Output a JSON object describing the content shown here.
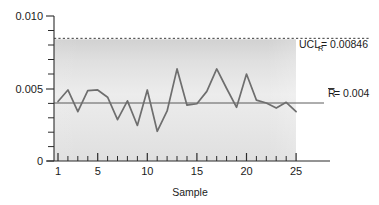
{
  "chart_data": {
    "type": "line",
    "title": "",
    "xlabel": "Sample",
    "ylabel": "",
    "xlim": [
      0.2,
      28.5
    ],
    "ylim": [
      0,
      0.01
    ],
    "grid": false,
    "legend_position": "none",
    "x_tick_labels": [
      "1",
      "5",
      "10",
      "15",
      "20",
      "25"
    ],
    "x_tick_values": [
      1,
      5,
      10,
      15,
      20,
      25
    ],
    "x_minor_ticks_every": 1,
    "y_tick_labels": [
      "0.010",
      "0.005",
      "0"
    ],
    "y_tick_values": [
      0.01,
      0.005,
      0
    ],
    "y_minor_ticks_every": 0.001,
    "series": [
      {
        "name": "R",
        "color": "#6e6e6e",
        "x": [
          1,
          2,
          3,
          4,
          5,
          6,
          7,
          8,
          9,
          10,
          11,
          12,
          13,
          14,
          15,
          16,
          17,
          18,
          19,
          20,
          21,
          22,
          23,
          24,
          25
        ],
        "values": [
          0.0041,
          0.0049,
          0.0034,
          0.00485,
          0.0049,
          0.0044,
          0.00285,
          0.00415,
          0.00245,
          0.0049,
          0.00205,
          0.00345,
          0.00635,
          0.00385,
          0.00395,
          0.0048,
          0.00635,
          0.005,
          0.0037,
          0.006,
          0.0042,
          0.004,
          0.00365,
          0.00405,
          0.0034
        ]
      }
    ],
    "control_limits": [
      {
        "key": "ucl",
        "label_main": "UCL",
        "label_sub": "R",
        "label_eq": " = 0.00846",
        "value": 0.00846,
        "style": "dashed",
        "color": "#3a3a3a"
      },
      {
        "key": "centerline",
        "label_main": "R",
        "label_sub": "",
        "label_eq": " = 0.004",
        "value": 0.004,
        "style": "solid",
        "color": "#4a4a4a",
        "overbar": true
      }
    ],
    "band": {
      "description": "shaded vertical gradient band behind plot area",
      "top_value": 0.00846,
      "bottom_value": 0
    }
  }
}
